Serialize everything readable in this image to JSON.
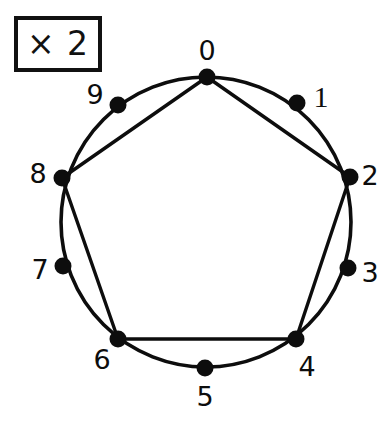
{
  "figure": {
    "badge": {
      "label": "× 2",
      "operator": "×",
      "multiplier": "2"
    },
    "background_color": "#ffffff",
    "ink_color": "#0d0d0d"
  },
  "circle": {
    "center_x": 206,
    "center_y": 222,
    "radius": 145,
    "stroke_color": "#0d0d0d",
    "stroke_width": 3.6
  },
  "nodes": [
    {
      "label": "0",
      "index": 0,
      "x": 207,
      "y": 77,
      "label_x": 207,
      "label_y": 50,
      "glyph": "digit"
    },
    {
      "label": "1",
      "index": 1,
      "x": 297,
      "y": 103,
      "label_x": 321,
      "label_y": 97,
      "glyph": "one"
    },
    {
      "label": "2",
      "index": 2,
      "x": 350,
      "y": 177,
      "label_x": 370,
      "label_y": 175,
      "glyph": "digit"
    },
    {
      "label": "3",
      "index": 3,
      "x": 348,
      "y": 268,
      "label_x": 370,
      "label_y": 272,
      "glyph": "digit"
    },
    {
      "label": "4",
      "index": 4,
      "x": 296,
      "y": 339,
      "label_x": 307,
      "label_y": 366,
      "glyph": "digit"
    },
    {
      "label": "5",
      "index": 5,
      "x": 205,
      "y": 368,
      "label_x": 205,
      "label_y": 396,
      "glyph": "digit"
    },
    {
      "label": "6",
      "index": 6,
      "x": 118,
      "y": 339,
      "label_x": 102,
      "label_y": 359,
      "glyph": "digit"
    },
    {
      "label": "7",
      "index": 7,
      "x": 63,
      "y": 266,
      "label_x": 40,
      "label_y": 269,
      "glyph": "digit"
    },
    {
      "label": "8",
      "index": 8,
      "x": 62,
      "y": 178,
      "label_x": 38,
      "label_y": 173,
      "glyph": "digit"
    },
    {
      "label": "9",
      "index": 9,
      "x": 118,
      "y": 105,
      "label_x": 95,
      "label_y": 94,
      "glyph": "nine"
    }
  ],
  "node_dot_radius": 8.5,
  "chords": [
    {
      "from": 0,
      "to": 2,
      "from_label": "0",
      "to_label": "2"
    },
    {
      "from": 2,
      "to": 4,
      "from_label": "2",
      "to_label": "4"
    },
    {
      "from": 4,
      "to": 6,
      "from_label": "4",
      "to_label": "6"
    },
    {
      "from": 6,
      "to": 8,
      "from_label": "6",
      "to_label": "8"
    },
    {
      "from": 8,
      "to": 0,
      "from_label": "8",
      "to_label": "0"
    }
  ],
  "chart_data": {
    "type": "diagram",
    "diagram_kind": "modular-multiplication-circle",
    "title": "× 2",
    "modulus": 10,
    "multiplier": 2,
    "point_labels": [
      "0",
      "1",
      "2",
      "3",
      "4",
      "5",
      "6",
      "7",
      "8",
      "9"
    ],
    "edges": [
      [
        0,
        0
      ],
      [
        1,
        2
      ],
      [
        2,
        4
      ],
      [
        3,
        6
      ],
      [
        4,
        8
      ],
      [
        5,
        0
      ],
      [
        6,
        2
      ],
      [
        7,
        4
      ],
      [
        8,
        6
      ],
      [
        9,
        8
      ]
    ],
    "drawn_chords": [
      [
        0,
        2
      ],
      [
        2,
        4
      ],
      [
        4,
        6
      ],
      [
        6,
        8
      ],
      [
        8,
        0
      ]
    ],
    "note": "Chords drawn connect n to 2n mod 10 for the even residues, forming a pentagon 0-2-4-6-8-0"
  }
}
